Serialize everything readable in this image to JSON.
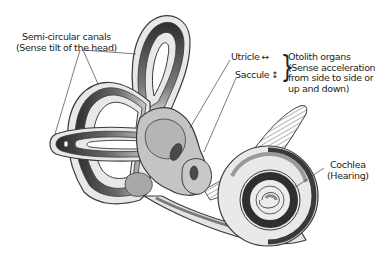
{
  "figure": {
    "colors": {
      "outline": "#3a3a3a",
      "fill_light": "#e6e6e6",
      "fill_mid": "#b9b9b9",
      "fill_dark": "#3b3b3b",
      "leader_line": "#444444",
      "text": "#231f20"
    }
  },
  "labels": {
    "semicircular_canals": {
      "line1": "Semi-circular canals",
      "line2": "(Sense tilt of the head)"
    },
    "utricle": {
      "text": "Utricle",
      "arrow": "↔"
    },
    "saccule": {
      "text": "Saccule",
      "arrow": "↕"
    },
    "otolith_organs": {
      "line1": "Otolith organs",
      "line2": "(Sense acceleration",
      "line3": "from side to side or",
      "line4": "up and down)"
    },
    "cochlea": {
      "line1": "Cochlea",
      "line2": "(Hearing)"
    },
    "brace": "}"
  }
}
